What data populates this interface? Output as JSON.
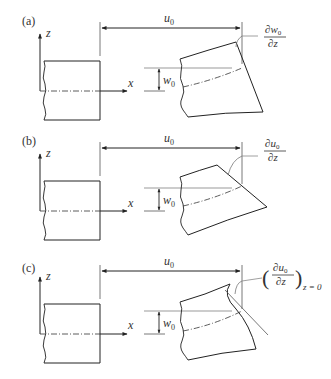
{
  "figure": {
    "axes": {
      "x_label": "x",
      "z_label": "z"
    },
    "panels": [
      {
        "label": "(a)",
        "dimension_label": "u",
        "dimension_sub": "0",
        "offset_label": "w",
        "offset_sub": "0",
        "angle_label_num": "∂w",
        "angle_label_num_sub": "0",
        "angle_label_den": "∂z",
        "section_shape": "straight rotated section"
      },
      {
        "label": "(b)",
        "dimension_label": "u",
        "dimension_sub": "0",
        "offset_label": "w",
        "offset_sub": "0",
        "angle_label_num": "∂u",
        "angle_label_num_sub": "0",
        "angle_label_den": "∂z",
        "section_shape": "straight section, non-perpendicular"
      },
      {
        "label": "(c)",
        "dimension_label": "u",
        "dimension_sub": "0",
        "offset_label": "w",
        "offset_sub": "0",
        "angle_label_num": "∂u",
        "angle_label_num_sub": "0",
        "angle_label_den": "∂z",
        "angle_label_paren_open": "(",
        "angle_label_paren_close": ")",
        "angle_label_condition": "z = 0",
        "section_shape": "warped section with tangent at mid-plane"
      }
    ]
  }
}
